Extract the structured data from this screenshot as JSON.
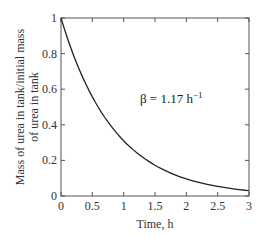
{
  "chart_data": {
    "type": "line",
    "title": "",
    "xlabel": "Time, h",
    "ylabel_line1": "Mass of urea in tank/initial mass",
    "ylabel_line2": "of urea in tank",
    "xlim": [
      0,
      3
    ],
    "ylim": [
      0,
      1
    ],
    "grid": false,
    "legend": null,
    "x_ticks": [
      "0",
      "0.5",
      "1",
      "1.5",
      "2",
      "2.5",
      "3"
    ],
    "y_ticks": [
      "0",
      "0.2",
      "0.4",
      "0.6",
      "0.8",
      "1"
    ],
    "annotation": {
      "prefix": "β = 1.17 h",
      "superscript": "−1"
    },
    "series": [
      {
        "name": "exp(-1.17 t)",
        "color": "#222222",
        "x": [
          0,
          0.25,
          0.5,
          0.75,
          1.0,
          1.25,
          1.5,
          1.75,
          2.0,
          2.25,
          2.5,
          2.75,
          3.0
        ],
        "values": [
          1.0,
          0.746,
          0.557,
          0.416,
          0.31,
          0.232,
          0.173,
          0.129,
          0.096,
          0.072,
          0.054,
          0.04,
          0.03
        ]
      }
    ]
  }
}
